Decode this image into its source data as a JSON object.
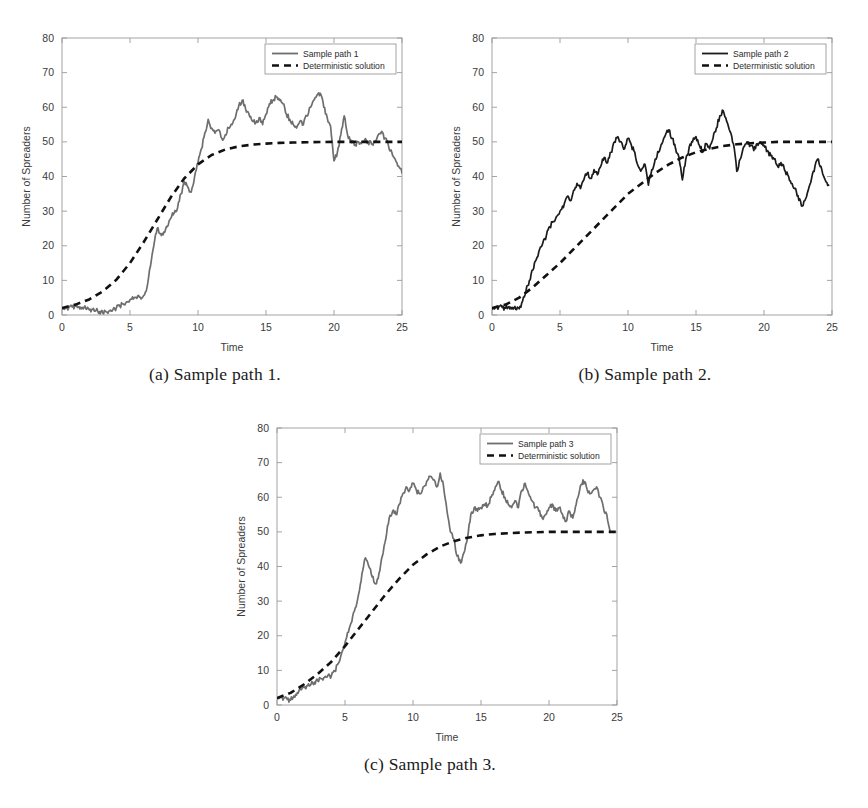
{
  "figure": {
    "panels": [
      {
        "id": "panel-a",
        "caption": "(a) Sample path 1.",
        "legend": {
          "sample_label": "Sample path 1",
          "deterministic_label": "Deterministic solution"
        },
        "chart_data": {
          "type": "line",
          "title": "",
          "xlabel": "Time",
          "ylabel": "Number of Spreaders",
          "xlim": [
            0,
            25
          ],
          "ylim": [
            0,
            80
          ],
          "xticks": [
            0,
            5,
            10,
            15,
            20,
            25
          ],
          "yticks": [
            0,
            10,
            20,
            30,
            40,
            50,
            60,
            70,
            80
          ],
          "grid": false,
          "legend_position": "top-right",
          "series": [
            {
              "name": "Sample path 1",
              "style": "solid",
              "color": "#6e6e6e",
              "x": [
                0,
                0.25,
                0.5,
                0.75,
                1,
                1.25,
                1.5,
                1.75,
                2,
                2.25,
                2.5,
                2.75,
                3,
                3.25,
                3.5,
                3.75,
                4,
                4.25,
                4.5,
                4.75,
                5,
                5.25,
                5.5,
                5.75,
                6,
                6.25,
                6.5,
                6.75,
                7,
                7.25,
                7.5,
                7.75,
                8,
                8.25,
                8.5,
                8.75,
                9,
                9.25,
                9.5,
                9.75,
                10,
                10.25,
                10.5,
                10.75,
                11,
                11.25,
                11.5,
                11.75,
                12,
                12.25,
                12.5,
                12.75,
                13,
                13.25,
                13.5,
                13.75,
                14,
                14.25,
                14.5,
                14.75,
                15,
                15.25,
                15.5,
                15.75,
                16,
                16.25,
                16.5,
                16.75,
                17,
                17.25,
                17.5,
                17.75,
                18,
                18.25,
                18.5,
                18.75,
                19,
                19.25,
                19.5,
                19.75,
                20,
                20.25,
                20.5,
                20.75,
                21,
                21.25,
                21.5,
                21.75,
                22,
                22.25,
                22.5,
                22.75,
                23,
                23.25,
                23.5,
                23.75,
                24,
                24.25,
                24.5,
                24.75,
                25
              ],
              "y": [
                2,
                2,
                2.2,
                2.3,
                2.6,
                2.4,
                2.2,
                1.8,
                1.5,
                1.6,
                1.3,
                1,
                0.6,
                0.9,
                1.2,
                1.6,
                2.1,
                2.6,
                3.2,
                3.8,
                4.4,
                4.6,
                4.8,
                5.2,
                5.6,
                8,
                14,
                20,
                25,
                23.5,
                24,
                25.5,
                28,
                29.5,
                31,
                35,
                38.5,
                37,
                35.5,
                40,
                44,
                48,
                52.5,
                56.5,
                54,
                52.5,
                53.5,
                51,
                52,
                54,
                55,
                57,
                60.5,
                62,
                59.5,
                58,
                56,
                55.5,
                57,
                55,
                58,
                61,
                62,
                63,
                62,
                61,
                58,
                56.5,
                55,
                54,
                56,
                55,
                57.5,
                60,
                62,
                63.5,
                64,
                60,
                57,
                54.5,
                44.5,
                47,
                52,
                57.5,
                52,
                50.5,
                49,
                50,
                49.5,
                50.5,
                50,
                49.5,
                50,
                52,
                53,
                51,
                49,
                47,
                45,
                43,
                41,
                39
              ]
            },
            {
              "name": "Deterministic solution",
              "style": "dashed",
              "color": "#111111",
              "x": [
                0,
                1,
                2,
                3,
                4,
                5,
                6,
                7,
                8,
                9,
                10,
                11,
                12,
                13,
                14,
                15,
                16,
                17,
                18,
                19,
                20,
                21,
                22,
                23,
                24,
                25
              ],
              "y": [
                2,
                3,
                4.5,
                6.8,
                10.2,
                15,
                21,
                27.5,
                34,
                39.5,
                43.5,
                46.2,
                47.8,
                48.7,
                49.2,
                49.5,
                49.7,
                49.8,
                49.9,
                49.95,
                50,
                50,
                50,
                50,
                50,
                50
              ]
            }
          ]
        }
      },
      {
        "id": "panel-b",
        "caption": "(b) Sample path 2.",
        "legend": {
          "sample_label": "Sample path 2",
          "deterministic_label": "Deterministic solution"
        },
        "chart_data": {
          "type": "line",
          "title": "",
          "xlabel": "Time",
          "ylabel": "Number of Spreaders",
          "xlim": [
            0,
            25
          ],
          "ylim": [
            0,
            80
          ],
          "xticks": [
            0,
            5,
            10,
            15,
            20,
            25
          ],
          "yticks": [
            0,
            10,
            20,
            30,
            40,
            50,
            60,
            70,
            80
          ],
          "grid": false,
          "legend_position": "top-right",
          "series": [
            {
              "name": "Sample path 2",
              "style": "solid",
              "color": "#1b1b1b",
              "x": [
                0,
                0.25,
                0.5,
                0.75,
                1,
                1.25,
                1.5,
                1.75,
                2,
                2.25,
                2.5,
                2.75,
                3,
                3.25,
                3.5,
                3.75,
                4,
                4.25,
                4.5,
                4.75,
                5,
                5.25,
                5.5,
                5.75,
                6,
                6.25,
                6.5,
                6.75,
                7,
                7.25,
                7.5,
                7.75,
                8,
                8.25,
                8.5,
                8.75,
                9,
                9.25,
                9.5,
                9.75,
                10,
                10.25,
                10.5,
                10.75,
                11,
                11.25,
                11.5,
                11.75,
                12,
                12.25,
                12.5,
                12.75,
                13,
                13.25,
                13.5,
                13.75,
                14,
                14.25,
                14.5,
                14.75,
                15,
                15.25,
                15.5,
                15.75,
                16,
                16.25,
                16.5,
                16.75,
                17,
                17.25,
                17.5,
                17.75,
                18,
                18.25,
                18.5,
                18.75,
                19,
                19.25,
                19.5,
                19.75,
                20,
                20.25,
                20.5,
                20.75,
                21,
                21.25,
                21.5,
                21.75,
                22,
                22.25,
                22.5,
                22.75,
                23,
                23.25,
                23.5,
                23.75,
                24,
                24.25,
                24.5,
                24.75,
                25
              ],
              "y": [
                2,
                2.2,
                2.4,
                2.2,
                2,
                2.4,
                2.2,
                1.6,
                1.8,
                4,
                7,
                10,
                13,
                16,
                19,
                21,
                23,
                25.5,
                27,
                28.5,
                30,
                31,
                34,
                33,
                36,
                38,
                36.5,
                39,
                41,
                39.5,
                42,
                40.5,
                43,
                45.5,
                44,
                47,
                50,
                51.5,
                50,
                48,
                51,
                49,
                47,
                43,
                42,
                43.5,
                37.5,
                42,
                45,
                47,
                49.5,
                52,
                53.5,
                51,
                48,
                45.5,
                39,
                45,
                48.5,
                50,
                51.5,
                49,
                47,
                49.5,
                48,
                51,
                54,
                57.5,
                59,
                56,
                53,
                49.5,
                41.5,
                45,
                48.5,
                50,
                49,
                47.5,
                49.5,
                50,
                49,
                47.5,
                46,
                45,
                43,
                44,
                42,
                40.5,
                38,
                36.5,
                34.5,
                31.5,
                33,
                36,
                39.5,
                43,
                45,
                42,
                39,
                37.5
              ]
            },
            {
              "name": "Deterministic solution",
              "style": "dashed",
              "color": "#111111",
              "x": [
                0,
                1,
                2,
                3,
                4,
                5,
                6,
                7,
                8,
                9,
                10,
                11,
                12,
                13,
                14,
                15,
                16,
                17,
                18,
                19,
                20,
                21,
                22,
                23,
                24,
                25
              ],
              "y": [
                2,
                3,
                5,
                8,
                11.5,
                15,
                19,
                23,
                27,
                31,
                35,
                38,
                41,
                43.5,
                45.5,
                47,
                48,
                48.8,
                49.3,
                49.6,
                49.8,
                50,
                50,
                50,
                50,
                50
              ]
            }
          ]
        }
      },
      {
        "id": "panel-c",
        "caption": "(c) Sample path 3.",
        "legend": {
          "sample_label": "Sample path 3",
          "deterministic_label": "Deterministic solution"
        },
        "chart_data": {
          "type": "line",
          "title": "",
          "xlabel": "Time",
          "ylabel": "Number of Spreaders",
          "xlim": [
            0,
            25
          ],
          "ylim": [
            0,
            80
          ],
          "xticks": [
            0,
            5,
            10,
            15,
            20,
            25
          ],
          "yticks": [
            0,
            10,
            20,
            30,
            40,
            50,
            60,
            70,
            80
          ],
          "grid": false,
          "legend_position": "top-right",
          "series": [
            {
              "name": "Sample path 3",
              "style": "solid",
              "color": "#6e6e6e",
              "x": [
                0,
                0.25,
                0.5,
                0.75,
                1,
                1.25,
                1.5,
                1.75,
                2,
                2.25,
                2.5,
                2.75,
                3,
                3.25,
                3.5,
                3.75,
                4,
                4.25,
                4.5,
                4.75,
                5,
                5.25,
                5.5,
                5.75,
                6,
                6.25,
                6.5,
                6.75,
                7,
                7.25,
                7.5,
                7.75,
                8,
                8.25,
                8.5,
                8.75,
                9,
                9.25,
                9.5,
                9.75,
                10,
                10.25,
                10.5,
                10.75,
                11,
                11.25,
                11.5,
                11.75,
                12,
                12.25,
                12.5,
                12.75,
                13,
                13.25,
                13.5,
                13.75,
                14,
                14.25,
                14.5,
                14.75,
                15,
                15.25,
                15.5,
                15.75,
                16,
                16.25,
                16.5,
                16.75,
                17,
                17.25,
                17.5,
                17.75,
                18,
                18.25,
                18.5,
                18.75,
                19,
                19.25,
                19.5,
                19.75,
                20,
                20.25,
                20.5,
                20.75,
                21,
                21.25,
                21.5,
                21.75,
                22,
                22.25,
                22.5,
                22.75,
                23,
                23.25,
                23.5,
                23.75,
                24,
                24.25,
                24.5,
                24.75,
                25
              ],
              "y": [
                2,
                2.4,
                2,
                1.6,
                1.4,
                2.6,
                3.6,
                4.4,
                5,
                5.6,
                6,
                6.6,
                7,
                7.6,
                8,
                8.6,
                8.4,
                9.8,
                12,
                15,
                18,
                21,
                24,
                28,
                32,
                38,
                42.5,
                40,
                37,
                35,
                38,
                43,
                48,
                54,
                56,
                55,
                58,
                61,
                63,
                62,
                64,
                62,
                61,
                63,
                64.5,
                66,
                65,
                63,
                67,
                63,
                56,
                50,
                48,
                43,
                41,
                44,
                48,
                55,
                57,
                56,
                57,
                58,
                57.5,
                60,
                62,
                64.5,
                62,
                60,
                58,
                57,
                59,
                57,
                62,
                64,
                61,
                59,
                57,
                56,
                54,
                55,
                57,
                58,
                56,
                57,
                55,
                53,
                56,
                54,
                58,
                62,
                65,
                63,
                61,
                62,
                63,
                60,
                57,
                55,
                50
              ]
            },
            {
              "name": "Deterministic solution",
              "style": "dashed",
              "color": "#111111",
              "x": [
                0,
                1,
                2,
                3,
                4,
                5,
                6,
                7,
                8,
                9,
                10,
                11,
                12,
                13,
                14,
                15,
                16,
                17,
                18,
                19,
                20,
                21,
                22,
                23,
                24,
                25
              ],
              "y": [
                2,
                3.5,
                6,
                9,
                12.5,
                17,
                22,
                27,
                32,
                36.5,
                40.5,
                43.5,
                45.8,
                47.3,
                48.3,
                49,
                49.4,
                49.6,
                49.8,
                49.9,
                50,
                50,
                50,
                50,
                50,
                50
              ]
            }
          ]
        }
      }
    ]
  }
}
